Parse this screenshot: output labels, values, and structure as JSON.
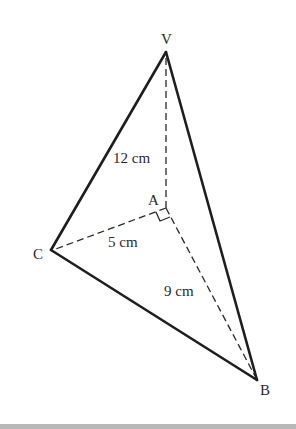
{
  "diagram": {
    "type": "pyramid",
    "vertices": {
      "V": {
        "label": "V",
        "x": 166,
        "y": 52
      },
      "A": {
        "label": "A",
        "x": 166,
        "y": 208
      },
      "B": {
        "label": "B",
        "x": 257,
        "y": 380
      },
      "C": {
        "label": "C",
        "x": 51,
        "y": 250
      }
    },
    "solid_edges": [
      [
        "V",
        "C"
      ],
      [
        "V",
        "B"
      ],
      [
        "C",
        "B"
      ]
    ],
    "dashed_edges": [
      [
        "V",
        "A"
      ],
      [
        "A",
        "C"
      ],
      [
        "A",
        "B"
      ]
    ],
    "right_angle_at": "A",
    "measurements": {
      "VA": "12 cm",
      "AC": "5 cm",
      "AB": "9 cm"
    },
    "colors": {
      "line": "#1e1e1e",
      "background": "#ffffff",
      "bottom_band": "#b8b8b8"
    }
  }
}
